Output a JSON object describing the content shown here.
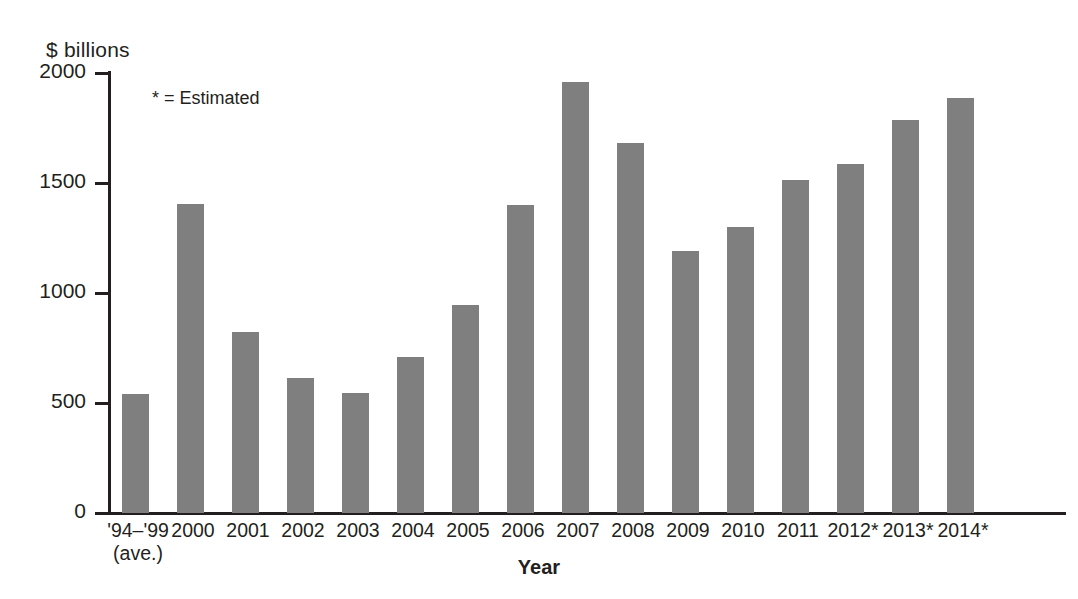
{
  "chart_data": {
    "type": "bar",
    "title": "",
    "subtitle": "",
    "xlabel": "Year",
    "ylabel": "$ billions",
    "ylim": [
      0,
      2000
    ],
    "yticks": [
      0,
      500,
      1000,
      1500,
      2000
    ],
    "ytick_labels": [
      "0",
      "500",
      "1000",
      "1500",
      "2000"
    ],
    "grid": false,
    "legend": null,
    "annotations": [
      "* = Estimated"
    ],
    "bar_color": "#7f7f7f",
    "bar_shadow_color": "#b2b2b2",
    "axis_color": "#231f20",
    "background_color": "#ffffff",
    "categories": [
      "'94–'99",
      "2000",
      "2001",
      "2002",
      "2003",
      "2004",
      "2005",
      "2006",
      "2007",
      "2008",
      "2009",
      "2010",
      "2011",
      "2012*",
      "2013*",
      "2014*"
    ],
    "category_sublabels": [
      "(ave.)",
      "",
      "",
      "",
      "",
      "",
      "",
      "",
      "",
      "",
      "",
      "",
      "",
      "",
      "",
      ""
    ],
    "values": [
      540,
      1405,
      825,
      615,
      545,
      710,
      945,
      1400,
      1960,
      1680,
      1190,
      1300,
      1515,
      1585,
      1785,
      1885
    ]
  },
  "labels": {
    "y_axis_unit": "$ billions",
    "x_axis_title": "Year",
    "estimated_note": "* = Estimated"
  }
}
